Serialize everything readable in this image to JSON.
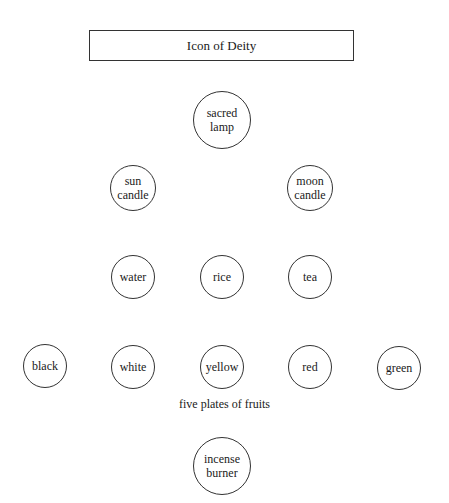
{
  "title": "Icon of Deity",
  "nodes": {
    "sacred_lamp": {
      "label": "sacred\nlamp",
      "cx": 222,
      "cy": 120,
      "r": 29
    },
    "sun_candle": {
      "label": "sun\ncandle",
      "cx": 133,
      "cy": 188,
      "r": 23
    },
    "moon_candle": {
      "label": "moon\ncandle",
      "cx": 310,
      "cy": 188,
      "r": 23
    },
    "water": {
      "label": "water",
      "cx": 133,
      "cy": 277,
      "r": 22
    },
    "rice": {
      "label": "rice",
      "cx": 222,
      "cy": 277,
      "r": 22
    },
    "tea": {
      "label": "tea",
      "cx": 310,
      "cy": 277,
      "r": 22
    },
    "black": {
      "label": "black",
      "cx": 45,
      "cy": 366,
      "r": 22
    },
    "white": {
      "label": "white",
      "cx": 133,
      "cy": 367,
      "r": 22
    },
    "yellow": {
      "label": "yellow",
      "cx": 222,
      "cy": 367,
      "r": 22
    },
    "red": {
      "label": "red",
      "cx": 310,
      "cy": 367,
      "r": 22
    },
    "green": {
      "label": "green",
      "cx": 399,
      "cy": 368,
      "r": 22
    },
    "incense_burner": {
      "label": "incense\nburner",
      "cx": 222,
      "cy": 466,
      "r": 29
    }
  },
  "fruits_caption": "five plates of fruits"
}
